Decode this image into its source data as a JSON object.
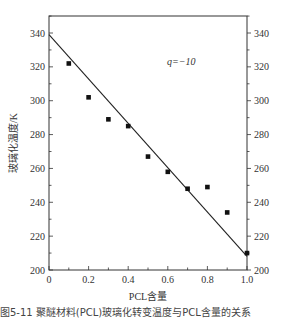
{
  "chart_data": {
    "type": "scatter",
    "title": "",
    "xlabel": "PCL含量",
    "ylabel": "玻璃化温度/K",
    "xlim": [
      0,
      1.0
    ],
    "ylim": [
      200,
      350
    ],
    "xticks": [
      0,
      0.2,
      0.4,
      0.6,
      0.8,
      1.0
    ],
    "xtick_labels": [
      "0",
      "0.2",
      "0.4",
      "0.6",
      "0.8",
      "1.0"
    ],
    "yticks": [
      200,
      220,
      240,
      260,
      280,
      300,
      320,
      340
    ],
    "ytick_labels": [
      "200",
      "220",
      "240",
      "260",
      "280",
      "300",
      "320",
      "340"
    ],
    "right_axis_mirrored": true,
    "grid": false,
    "annotation": "q=−10",
    "series": [
      {
        "name": "experimental",
        "type": "scatter",
        "marker": "square",
        "x": [
          0.1,
          0.2,
          0.3,
          0.4,
          0.5,
          0.6,
          0.7,
          0.8,
          0.9,
          1.0
        ],
        "y": [
          322,
          302,
          289,
          285,
          267,
          258,
          248,
          249,
          234,
          210
        ]
      },
      {
        "name": "fit",
        "type": "line",
        "x": [
          0,
          1.0
        ],
        "y": [
          339,
          208
        ]
      }
    ]
  },
  "caption": "图5-11 聚醚材料(PCL)玻璃化转变温度与PCL含量的关系"
}
